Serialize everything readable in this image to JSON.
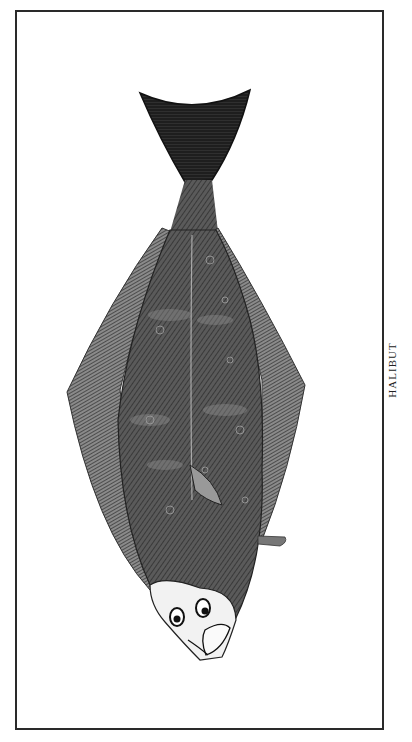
{
  "plate": {
    "caption": "HALIBUT",
    "subject": "halibut-illustration",
    "colors": {
      "ink": "#2a2a2a",
      "body": "#4a4a4a",
      "fin": "#6a6a6a",
      "tail": "#1e1e1e",
      "head": "#f2f2f2",
      "paper": "#ffffff"
    }
  }
}
